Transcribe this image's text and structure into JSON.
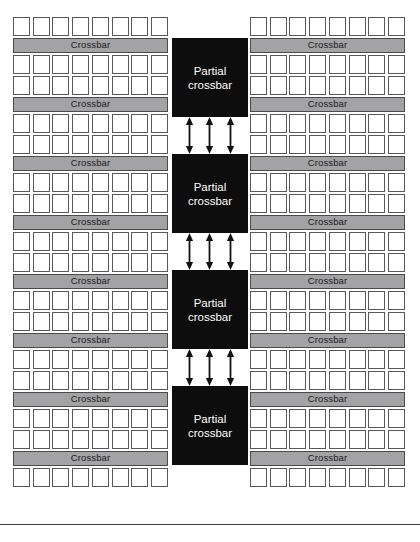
{
  "figure": {
    "name": "tiled-partial-crossbar-interconnect-diagram",
    "colors": {
      "page_background": "#ffffff",
      "pe_fill": "#ffffff",
      "pe_border": "#58585a",
      "crossbar_fill": "#a3a3a5",
      "crossbar_border": "#4a4a4c",
      "crossbar_text": "#1a1a1a",
      "partial_crossbar_fill": "#0d0d0d",
      "partial_crossbar_text": "#ffffff",
      "arrow_color": "#111111",
      "rule_color": "#3c3c3e"
    },
    "labels": {
      "crossbar": "Crossbar",
      "partial_crossbar_line1": "Partial",
      "partial_crossbar_line2": "crossbar"
    },
    "pe_per_row": 8,
    "left_column": {
      "name": "left-processing-cluster",
      "rows": [
        {
          "type": "pe_row"
        },
        {
          "type": "crossbar"
        },
        {
          "type": "pe_row"
        },
        {
          "type": "pe_row"
        },
        {
          "type": "crossbar"
        },
        {
          "type": "pe_row"
        },
        {
          "type": "pe_row"
        },
        {
          "type": "crossbar"
        },
        {
          "type": "pe_row"
        },
        {
          "type": "pe_row"
        },
        {
          "type": "crossbar"
        },
        {
          "type": "pe_row"
        },
        {
          "type": "pe_row"
        },
        {
          "type": "crossbar"
        },
        {
          "type": "pe_row"
        },
        {
          "type": "pe_row"
        },
        {
          "type": "crossbar"
        },
        {
          "type": "pe_row"
        },
        {
          "type": "pe_row"
        },
        {
          "type": "crossbar"
        },
        {
          "type": "pe_row"
        },
        {
          "type": "pe_row"
        },
        {
          "type": "crossbar"
        },
        {
          "type": "pe_row"
        }
      ]
    },
    "right_column": {
      "name": "right-processing-cluster",
      "rows": [
        {
          "type": "pe_row"
        },
        {
          "type": "crossbar"
        },
        {
          "type": "pe_row"
        },
        {
          "type": "pe_row"
        },
        {
          "type": "crossbar"
        },
        {
          "type": "pe_row"
        },
        {
          "type": "pe_row"
        },
        {
          "type": "crossbar"
        },
        {
          "type": "pe_row"
        },
        {
          "type": "pe_row"
        },
        {
          "type": "crossbar"
        },
        {
          "type": "pe_row"
        },
        {
          "type": "pe_row"
        },
        {
          "type": "crossbar"
        },
        {
          "type": "pe_row"
        },
        {
          "type": "pe_row"
        },
        {
          "type": "crossbar"
        },
        {
          "type": "pe_row"
        },
        {
          "type": "pe_row"
        },
        {
          "type": "crossbar"
        },
        {
          "type": "pe_row"
        },
        {
          "type": "pe_row"
        },
        {
          "type": "crossbar"
        },
        {
          "type": "pe_row"
        }
      ]
    },
    "center_column": {
      "name": "partial-crossbar-spine",
      "blocks": [
        {
          "type": "partial_crossbar"
        },
        {
          "type": "arrow_band",
          "arrows": 3,
          "direction": "bidirectional"
        },
        {
          "type": "partial_crossbar"
        },
        {
          "type": "arrow_band",
          "arrows": 3,
          "direction": "bidirectional"
        },
        {
          "type": "partial_crossbar"
        },
        {
          "type": "arrow_band",
          "arrows": 3,
          "direction": "bidirectional"
        },
        {
          "type": "partial_crossbar"
        }
      ]
    },
    "bottom_rule": {
      "name": "figure-bottom-rule"
    }
  }
}
